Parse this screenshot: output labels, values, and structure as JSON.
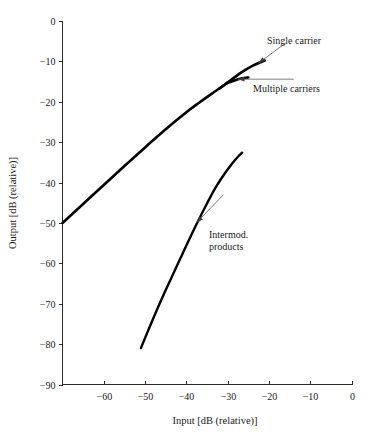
{
  "figure": {
    "background_color": "#ffffff",
    "ink_color": "#000000",
    "leader_color": "#6e6e6e"
  },
  "chart_data": {
    "type": "line",
    "title": "",
    "subtitle": "",
    "xlabel": "Input [dB (relative)]",
    "ylabel": "Output [dB (relative)]",
    "xlim": [
      -70,
      0
    ],
    "ylim": [
      -90,
      0
    ],
    "xticks": [
      -60,
      -50,
      -40,
      -30,
      -20,
      -10,
      0
    ],
    "xtick_labels": [
      "−60",
      "−50",
      "−40",
      "−30",
      "−20",
      "−10",
      "0"
    ],
    "yticks": [
      0,
      -10,
      -20,
      -30,
      -40,
      -50,
      -60,
      -70,
      -80,
      -90
    ],
    "ytick_labels": [
      "0",
      "−10",
      "−20",
      "−30",
      "−40",
      "−50",
      "−60",
      "−70",
      "−80",
      "−90"
    ],
    "grid": false,
    "legend_position": "inline-annotations",
    "series": [
      {
        "name": "Single carrier",
        "points": [
          [
            -70,
            -50.0
          ],
          [
            -65,
            -45.3
          ],
          [
            -60,
            -40.6
          ],
          [
            -55,
            -35.9
          ],
          [
            -50,
            -31.3
          ],
          [
            -45,
            -26.8
          ],
          [
            -40,
            -22.6
          ],
          [
            -37,
            -20.3
          ],
          [
            -34,
            -18.1
          ],
          [
            -32,
            -16.7
          ],
          [
            -30,
            -15.2
          ],
          [
            -28,
            -13.7
          ],
          [
            -26,
            -12.3
          ],
          [
            -24,
            -11.1
          ],
          [
            -22,
            -10.2
          ],
          [
            -21,
            -9.8
          ]
        ]
      },
      {
        "name": "Multiple carriers",
        "points": [
          [
            -32,
            -16.7
          ],
          [
            -31,
            -16.0
          ],
          [
            -30,
            -15.4
          ],
          [
            -29,
            -15.0
          ],
          [
            -28,
            -14.6
          ],
          [
            -27,
            -14.3
          ],
          [
            -26,
            -14.1
          ],
          [
            -25,
            -14.0
          ]
        ]
      },
      {
        "name": "Intermod. products",
        "points": [
          [
            -51,
            -81.0
          ],
          [
            -49,
            -76.0
          ],
          [
            -47,
            -71.2
          ],
          [
            -45,
            -66.6
          ],
          [
            -43,
            -62.2
          ],
          [
            -41,
            -57.8
          ],
          [
            -39,
            -53.4
          ],
          [
            -37,
            -49.2
          ],
          [
            -35,
            -45.2
          ],
          [
            -33,
            -41.4
          ],
          [
            -31,
            -38.2
          ],
          [
            -29,
            -35.4
          ],
          [
            -27.5,
            -33.6
          ],
          [
            -26.5,
            -32.6
          ]
        ]
      }
    ],
    "annotations": [
      {
        "id": "single-carrier",
        "text": "Single carrier",
        "text_lines": [
          "Single carrier"
        ],
        "target_point": [
          -22.5,
          -10.4
        ],
        "label_point": [
          -16.0,
          -5.5
        ]
      },
      {
        "id": "multiple-carriers",
        "text": "Multiple carriers",
        "text_lines": [
          "Multiple carriers"
        ],
        "target_point": [
          -27.5,
          -14.4
        ],
        "label_point": [
          -14.0,
          -14.4
        ]
      },
      {
        "id": "intermod-products",
        "text": "Intermod. products",
        "text_lines": [
          "Intermod.",
          "products"
        ],
        "target_point": [
          -37.5,
          -49.9
        ],
        "label_point": [
          -31.0,
          -43.0
        ]
      }
    ]
  }
}
